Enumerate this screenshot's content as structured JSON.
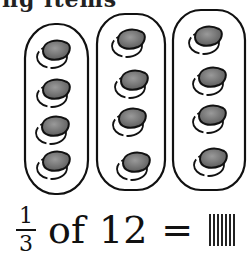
{
  "header": {
    "partial_text": "ng items"
  },
  "groups": {
    "count": 3,
    "items_per_group": 4,
    "leaf_color": "#7a7a7a",
    "outline_color": "#111111"
  },
  "equation": {
    "fraction_numerator": "1",
    "fraction_denominator": "3",
    "of_word": "of",
    "total": "12",
    "equals": "=",
    "answer_tally_marks": 7
  }
}
